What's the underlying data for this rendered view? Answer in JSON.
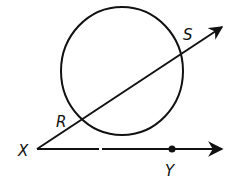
{
  "diagram": {
    "colors": {
      "stroke": "#111111",
      "background": "#ffffff"
    },
    "circle": {
      "cx": 122,
      "cy": 71,
      "rx": 61,
      "ry": 64
    },
    "points": {
      "X": {
        "label": "X",
        "x": 37,
        "y": 149
      },
      "R": {
        "label": "R",
        "x": 82,
        "y": 118
      },
      "S": {
        "label": "S",
        "x": 181,
        "y": 55
      },
      "Y": {
        "label": "Y",
        "x": 172,
        "y": 149
      }
    },
    "rays": [
      {
        "name": "ray-XS",
        "from": "X",
        "through": "S",
        "end": [
          222,
          27
        ]
      },
      {
        "name": "ray-XY",
        "from": "X",
        "through": "Y",
        "end": [
          222,
          149
        ]
      }
    ]
  }
}
